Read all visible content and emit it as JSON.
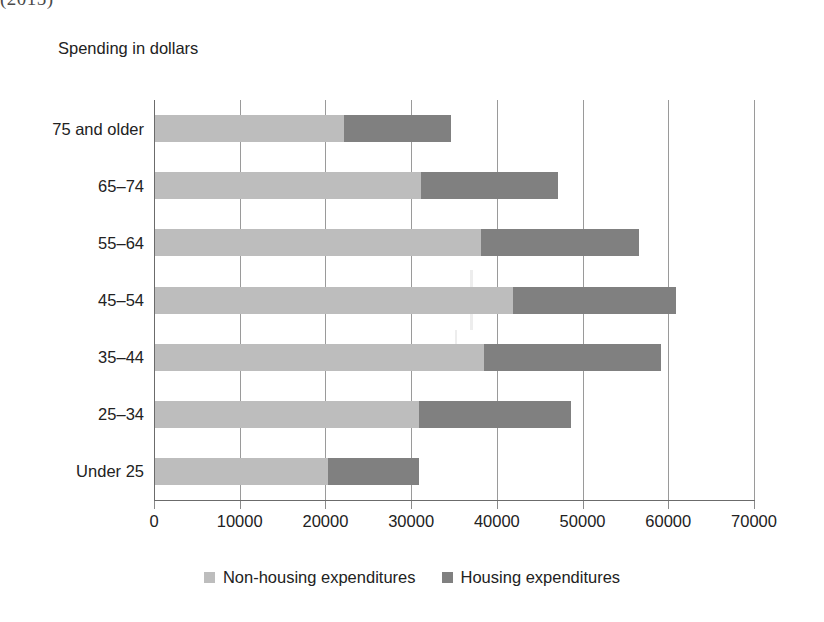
{
  "caption_fragment": "(2015)",
  "axis_title": "Spending in\ndollars",
  "legend": [
    {
      "label": "Non-housing expenditures",
      "color": "#bdbdbd",
      "swatch": "square-swatch-icon"
    },
    {
      "label": "Housing expenditures",
      "color": "#808080",
      "swatch": "square-swatch-icon"
    }
  ],
  "chart_data": {
    "type": "bar",
    "orientation": "horizontal",
    "stacked": true,
    "title": "",
    "subtitle": "",
    "xlabel": "",
    "ylabel": "Spending in dollars",
    "xlim": [
      0,
      70000
    ],
    "ylim": null,
    "grid": true,
    "grid_axis": "x",
    "legend_position": "bottom",
    "xticks": [
      0,
      10000,
      20000,
      30000,
      40000,
      50000,
      60000,
      70000
    ],
    "xtick_labels": [
      "0",
      "10000",
      "20000",
      "30000",
      "40000",
      "50000",
      "60000",
      "70000"
    ],
    "categories": [
      "75 and older",
      "65–74",
      "55–64",
      "45–54",
      "35–44",
      "25–34",
      "Under 25"
    ],
    "series": [
      {
        "name": "Non-housing expenditures",
        "color": "#bdbdbd",
        "values": [
          22000,
          31000,
          38000,
          41800,
          38400,
          30800,
          20200
        ]
      },
      {
        "name": "Housing expenditures",
        "color": "#808080",
        "values": [
          12500,
          16000,
          18500,
          19000,
          20600,
          17700,
          10600
        ]
      }
    ],
    "totals": [
      34500,
      47000,
      56500,
      60800,
      59000,
      48500,
      30800
    ]
  }
}
